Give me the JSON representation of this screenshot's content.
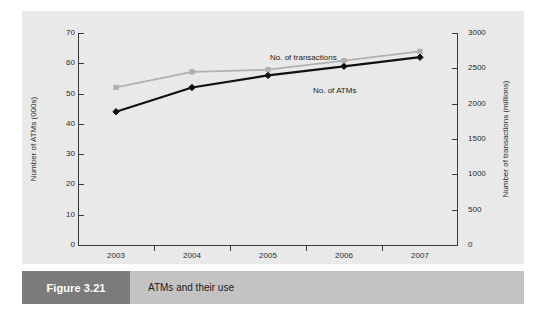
{
  "figure": {
    "number_label": "Figure 3.21",
    "caption": "ATMs and their use"
  },
  "chart_data": {
    "type": "line",
    "title": "",
    "subtitle": "",
    "xlabel": "",
    "categories": [
      "2003",
      "2004",
      "2005",
      "2006",
      "2007"
    ],
    "x_tick_labels": [
      "2003",
      "2004",
      "2005",
      "2006",
      "2007"
    ],
    "grid": false,
    "legend_position": "inline-annotation",
    "axes": {
      "left": {
        "label": "Number of ATMs (000s)",
        "ticks": [
          0,
          10,
          20,
          30,
          40,
          50,
          60,
          70
        ],
        "tick_labels": [
          "0",
          "10",
          "20",
          "30",
          "40",
          "50",
          "60",
          "70"
        ],
        "range": [
          0,
          70
        ],
        "units": "thousands"
      },
      "right": {
        "label": "Number of transactions (millions)",
        "ticks": [
          0,
          500,
          1000,
          1500,
          2000,
          2500,
          3000
        ],
        "tick_labels": [
          "0",
          "500",
          "1000",
          "1500",
          "2000",
          "2500",
          "3000"
        ],
        "range": [
          0,
          3000
        ],
        "units": "millions"
      }
    },
    "series": [
      {
        "name": "No. of ATMs",
        "axis": "left",
        "color": "#111111",
        "marker": "diamond",
        "values": [
          44,
          52,
          56,
          59,
          62
        ]
      },
      {
        "name": "No. of transactions",
        "axis": "right",
        "color": "#b0b0b0",
        "marker": "square",
        "values": [
          2230,
          2450,
          2480,
          2610,
          2740
        ]
      }
    ],
    "annotations": [
      {
        "text": "No. of transactions",
        "series": "No. of transactions"
      },
      {
        "text": "No. of ATMs",
        "series": "No. of ATMs"
      }
    ],
    "colors": {
      "panel_background": "#e9e9e9",
      "page_background": "#ffffff",
      "axis": "#3a3a3a",
      "caption_bar": "#c3c3c3",
      "figure_number_box": "#7b7b7b"
    }
  }
}
